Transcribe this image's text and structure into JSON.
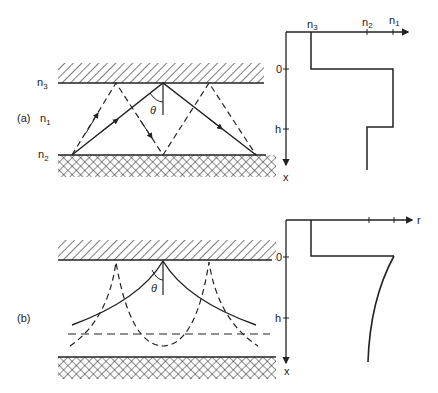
{
  "panel_a": {
    "label": "(a)",
    "layers": {
      "top": "n",
      "top_sub": "3",
      "core": "n",
      "core_sub": "1",
      "bottom": "n",
      "bottom_sub": "2"
    },
    "angle": "θ",
    "profile": {
      "axis_labels": {
        "x": "x",
        "zero": "0",
        "h": "h"
      },
      "ticks": [
        {
          "t": "n",
          "s": "3"
        },
        {
          "t": "n",
          "s": "2"
        },
        {
          "t": "n",
          "s": "1"
        }
      ]
    }
  },
  "panel_b": {
    "label": "(b)",
    "angle": "θ",
    "profile": {
      "axis_labels": {
        "x": "x",
        "zero": "0",
        "h": "h",
        "n": "r"
      }
    }
  }
}
